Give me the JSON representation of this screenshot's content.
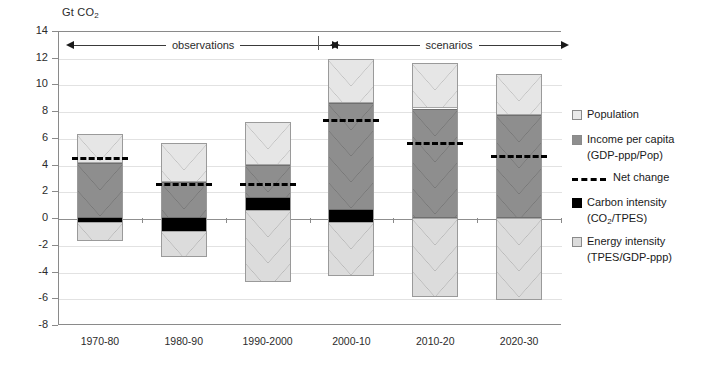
{
  "axis_unit_prefix": "Gt CO",
  "axis_unit_sub": "2",
  "annotations": {
    "observations": "observations",
    "scenarios": "scenarios"
  },
  "legend": {
    "population": "Population",
    "income": "Income per capita",
    "income_sub_prefix": "(GDP-ppp/Pop)",
    "net_change": "Net change",
    "carbon": "Carbon intensity",
    "carbon_sub_prefix": "(CO",
    "carbon_sub_sub": "2",
    "carbon_sub_suffix": "/TPES)",
    "energy": "Energy intensity",
    "energy_sub": "(TPES/GDP-ppp)"
  },
  "colors": {
    "population": "#e6e6e6",
    "income": "#8e8e8e",
    "carbon": "#000000",
    "energy": "#dcdcdc",
    "net_change": "#000000",
    "grid": "#e2e2e2",
    "axis": "#8a8a8a"
  },
  "chart_data": {
    "type": "bar",
    "title": "",
    "subtitle": "",
    "xlabel": "",
    "ylabel": "Gt CO2",
    "ylim": [
      -8,
      14
    ],
    "ytick_step": 2,
    "yticks": [
      14,
      12,
      10,
      8,
      6,
      4,
      2,
      0,
      -2,
      -4,
      -6,
      -8
    ],
    "grid": true,
    "legend_position": "right",
    "stacked": true,
    "categories": [
      "1970-80",
      "1980-90",
      "1990-2000",
      "2000-10",
      "2010-20",
      "2020-30"
    ],
    "series": [
      {
        "name": "Population",
        "values": [
          2.2,
          2.9,
          3.2,
          3.3,
          3.4,
          3.1
        ]
      },
      {
        "name": "Income per capita",
        "values": [
          4.1,
          2.7,
          2.5,
          8.6,
          8.2,
          7.7
        ]
      },
      {
        "name": "Carbon intensity",
        "values": [
          -0.3,
          -1.0,
          -0.9,
          -0.9,
          0.0,
          0.0
        ]
      },
      {
        "name": "Energy intensity",
        "values": [
          -1.4,
          -1.9,
          -3.9,
          -3.4,
          -5.9,
          -6.1
        ]
      }
    ],
    "net_change": {
      "name": "Net change",
      "values": [
        4.6,
        2.6,
        2.6,
        7.4,
        5.7,
        4.7
      ]
    },
    "segment_bounds": [
      {
        "category": "1970-80",
        "population": [
          4.1,
          6.3
        ],
        "income": [
          0.0,
          4.1
        ],
        "carbon": [
          -0.3,
          0.0
        ],
        "energy": [
          -1.7,
          -0.3
        ]
      },
      {
        "category": "1980-90",
        "population": [
          2.7,
          5.6
        ],
        "income": [
          0.0,
          2.7
        ],
        "carbon": [
          -1.0,
          0.0
        ],
        "energy": [
          -2.9,
          -1.0
        ]
      },
      {
        "category": "1990-2000",
        "population": [
          4.0,
          7.2
        ],
        "income": [
          1.5,
          4.0
        ],
        "carbon": [
          0.6,
          1.5
        ],
        "energy": [
          -4.8,
          0.6
        ]
      },
      {
        "category": "2000-10",
        "population": [
          8.6,
          11.9
        ],
        "income": [
          0.6,
          8.6
        ],
        "carbon": [
          -0.3,
          0.6
        ],
        "energy": [
          -4.3,
          -0.3
        ]
      },
      {
        "category": "2010-20",
        "population": [
          8.2,
          11.6
        ],
        "income": [
          0.0,
          8.2
        ],
        "carbon": [
          0.0,
          0.0
        ],
        "energy": [
          -5.9,
          0.0
        ]
      },
      {
        "category": "2020-30",
        "population": [
          7.7,
          10.8
        ],
        "income": [
          0.0,
          7.7
        ],
        "carbon": [
          0.0,
          0.0
        ],
        "energy": [
          -6.1,
          0.0
        ]
      }
    ]
  }
}
